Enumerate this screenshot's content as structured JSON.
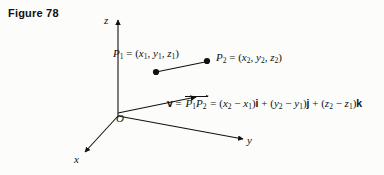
{
  "figure": {
    "title": "Figure 78",
    "background_color": "#fcfcfa",
    "ink_color": "#111111"
  },
  "axes": {
    "z_label": "z",
    "x_label": "x",
    "y_label": "y",
    "origin_label": "O"
  },
  "points": {
    "p1": {
      "name": "P1",
      "label_name": "P",
      "label_sub": "1",
      "eq": " = (",
      "coord_x": "x",
      "coord_x_sub": "1",
      "sep1": ", ",
      "coord_y": "y",
      "coord_y_sub": "1",
      "sep2": ", ",
      "coord_z": "z",
      "coord_z_sub": "1",
      "close": ")"
    },
    "p2": {
      "name": "P2",
      "label_name": "P",
      "label_sub": "2",
      "eq": " = (",
      "coord_x": "x",
      "coord_x_sub": "2",
      "sep1": ", ",
      "coord_y": "y",
      "coord_y_sub": "2",
      "sep2": ", ",
      "coord_z": "z",
      "coord_z_sub": "2",
      "close": ")"
    }
  },
  "equation": {
    "vector_symbol": "v",
    "equals1": " = ",
    "pp_first": "P",
    "pp_first_sub": "1",
    "pp_second": "P",
    "pp_second_sub": "2",
    "equals2": " = (",
    "term1_a": "x",
    "term1_a_sub": "2",
    "minus1": " − ",
    "term1_b": "x",
    "term1_b_sub": "1",
    "close1": ")",
    "unit_i": "i",
    "plus1": " + (",
    "term2_a": "y",
    "term2_a_sub": "2",
    "minus2": " − ",
    "term2_b": "y",
    "term2_b_sub": "1",
    "close2": ")",
    "unit_j": "j",
    "plus2": " + (",
    "term3_a": "z",
    "term3_a_sub": "2",
    "minus3": " − ",
    "term3_b": "z",
    "term3_b_sub": "1",
    "close3": ")",
    "unit_k": "k"
  }
}
